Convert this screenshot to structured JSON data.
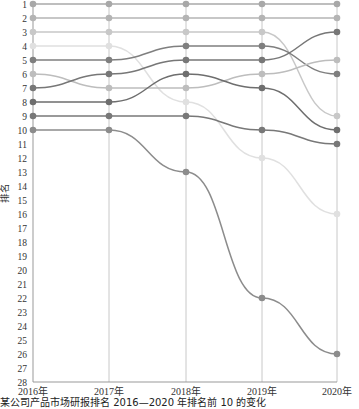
{
  "chart_data": {
    "type": "line",
    "subtype": "bump",
    "title": "",
    "caption": "某公司产品市场研报排名 2016—2020 年排名前 10 的变化",
    "xlabel": "",
    "ylabel": "排名",
    "x": [
      "2016年",
      "2017年",
      "2018年",
      "2019年",
      "2020年"
    ],
    "ylim": [
      1,
      28
    ],
    "y_inverted": true,
    "y_ticks": [
      1,
      2,
      3,
      4,
      5,
      6,
      7,
      8,
      9,
      10,
      11,
      12,
      13,
      14,
      15,
      16,
      17,
      18,
      19,
      20,
      21,
      22,
      23,
      24,
      25,
      26,
      27,
      28
    ],
    "grid": "vertical lines at each year",
    "legend": "none",
    "series": [
      {
        "name": "S1",
        "values": [
          1,
          1,
          1,
          1,
          1
        ],
        "color": "#a8a8a8"
      },
      {
        "name": "S2",
        "values": [
          2,
          2,
          2,
          2,
          2
        ],
        "color": "#b4b4b4"
      },
      {
        "name": "S3",
        "values": [
          3,
          3,
          3,
          3,
          9
        ],
        "color": "#c8c8c8"
      },
      {
        "name": "S4",
        "values": [
          4,
          4,
          8,
          12,
          16
        ],
        "color": "#e0e0e0"
      },
      {
        "name": "S5",
        "values": [
          5,
          5,
          4,
          4,
          6
        ],
        "color": "#7f7f7f"
      },
      {
        "name": "S6",
        "values": [
          6,
          7,
          7,
          6,
          5
        ],
        "color": "#bdbdbd"
      },
      {
        "name": "S7",
        "values": [
          7,
          6,
          5,
          5,
          3
        ],
        "color": "#777777"
      },
      {
        "name": "S8",
        "values": [
          8,
          8,
          6,
          7,
          10
        ],
        "color": "#6e6e6e"
      },
      {
        "name": "S9",
        "values": [
          9,
          9,
          9,
          10,
          11
        ],
        "color": "#787878"
      },
      {
        "name": "S10",
        "values": [
          10,
          10,
          13,
          22,
          26
        ],
        "color": "#8c8c8c"
      }
    ]
  }
}
